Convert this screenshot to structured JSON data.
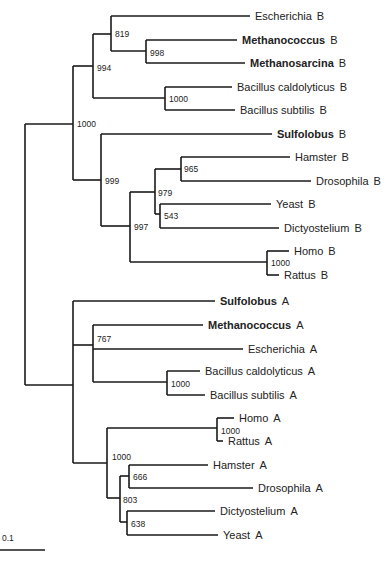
{
  "chart_data": {
    "type": "phylogenetic_tree",
    "title": "",
    "scale_bar": {
      "label": "0.1",
      "x1": 0,
      "x2": 45,
      "y": 550,
      "label_x": 2,
      "label_y": 541
    },
    "leaves": [
      {
        "id": "escherichia_b",
        "label": "Escherichia",
        "suffix": "B",
        "bold": false,
        "x": 250,
        "y": 16
      },
      {
        "id": "methanococcus_b",
        "label": "Methanococcus",
        "suffix": "B",
        "bold": true,
        "x": 237,
        "y": 40
      },
      {
        "id": "methanosarcina_b",
        "label": "Methanosarcina",
        "suffix": "B",
        "bold": true,
        "x": 245,
        "y": 63
      },
      {
        "id": "bacillus_caldolyticus_b",
        "label": "Bacillus caldolyticus",
        "suffix": "B",
        "bold": false,
        "x": 232,
        "y": 87
      },
      {
        "id": "bacillus_subtilis_b",
        "label": "Bacillus subtilis",
        "suffix": "B",
        "bold": false,
        "x": 235,
        "y": 110
      },
      {
        "id": "sulfolobus_b",
        "label": "Sulfolobus",
        "suffix": "B",
        "bold": true,
        "x": 272,
        "y": 134
      },
      {
        "id": "hamster_b",
        "label": "Hamster",
        "suffix": "B",
        "bold": false,
        "x": 290,
        "y": 157
      },
      {
        "id": "drosophila_b",
        "label": "Drosophila",
        "suffix": "B",
        "bold": false,
        "x": 311,
        "y": 181
      },
      {
        "id": "yeast_b",
        "label": "Yeast",
        "suffix": "B",
        "bold": false,
        "x": 271,
        "y": 204
      },
      {
        "id": "dictyostelium_b",
        "label": "Dictyostelium",
        "suffix": "B",
        "bold": false,
        "x": 279,
        "y": 228
      },
      {
        "id": "homo_b",
        "label": "Homo",
        "suffix": "B",
        "bold": false,
        "x": 289,
        "y": 251
      },
      {
        "id": "rattus_b",
        "label": "Rattus",
        "suffix": "B",
        "bold": false,
        "x": 279,
        "y": 275
      },
      {
        "id": "sulfolobus_a",
        "label": "Sulfolobus",
        "suffix": "A",
        "bold": true,
        "x": 215,
        "y": 301
      },
      {
        "id": "methanococcus_a",
        "label": "Methanococcus",
        "suffix": "A",
        "bold": true,
        "x": 203,
        "y": 325
      },
      {
        "id": "escherichia_a",
        "label": "Escherichia",
        "suffix": "A",
        "bold": false,
        "x": 243,
        "y": 349
      },
      {
        "id": "bacillus_caldolyticus_a",
        "label": "Bacillus caldolyticus",
        "suffix": "A",
        "bold": false,
        "x": 200,
        "y": 371
      },
      {
        "id": "bacillus_subtilis_a",
        "label": "Bacillus subtilis",
        "suffix": "A",
        "bold": false,
        "x": 205,
        "y": 395
      },
      {
        "id": "homo_a",
        "label": "Homo",
        "suffix": "A",
        "bold": false,
        "x": 234,
        "y": 418
      },
      {
        "id": "rattus_a",
        "label": "Rattus",
        "suffix": "A",
        "bold": false,
        "x": 223,
        "y": 441
      },
      {
        "id": "hamster_a",
        "label": "Hamster",
        "suffix": "A",
        "bold": false,
        "x": 208,
        "y": 465
      },
      {
        "id": "drosophila_a",
        "label": "Drosophila",
        "suffix": "A",
        "bold": false,
        "x": 253,
        "y": 488
      },
      {
        "id": "dictyostelium_a",
        "label": "Dictyostelium",
        "suffix": "A",
        "bold": false,
        "x": 215,
        "y": 511
      },
      {
        "id": "yeast_a",
        "label": "Yeast",
        "suffix": "A",
        "bold": false,
        "x": 218,
        "y": 535
      }
    ],
    "nodes": [
      {
        "id": "root",
        "x": 25,
        "y_top": 124,
        "y_bottom": 385,
        "parent_y": null,
        "bootstrap": ""
      },
      {
        "id": "clade_b",
        "x": 73,
        "y_top": 66,
        "y_bottom": 180,
        "parent_y": 124,
        "bootstrap": "1000",
        "label_x": 77,
        "label_y": 127
      },
      {
        "id": "bact_arch_b",
        "x": 93,
        "y_top": 34,
        "y_bottom": 98,
        "parent_y": 66,
        "bootstrap": "994",
        "label_x": 97,
        "label_y": 71
      },
      {
        "id": "esch_meth_b",
        "x": 111,
        "y_top": 16,
        "y_bottom": 51,
        "parent_y": 34,
        "bootstrap": "819",
        "label_x": 115,
        "label_y": 37
      },
      {
        "id": "meth_b",
        "x": 146,
        "y_top": 40,
        "y_bottom": 63,
        "parent_y": 51,
        "bootstrap": "998",
        "label_x": 150,
        "label_y": 56
      },
      {
        "id": "bacillus_b",
        "x": 165,
        "y_top": 87,
        "y_bottom": 110,
        "parent_y": 98,
        "bootstrap": "1000",
        "label_x": 169,
        "label_y": 102
      },
      {
        "id": "euk_sulf_b",
        "x": 101,
        "y_top": 134,
        "y_bottom": 226,
        "parent_y": 180,
        "bootstrap": "999",
        "label_x": 105,
        "label_y": 184
      },
      {
        "id": "euk_b",
        "x": 130,
        "y_top": 192,
        "y_bottom": 262,
        "parent_y": 226,
        "bootstrap": "997",
        "label_x": 134,
        "label_y": 230
      },
      {
        "id": "euk_sub_b",
        "x": 155,
        "y_top": 169,
        "y_bottom": 214,
        "parent_y": 192,
        "bootstrap": "979",
        "label_x": 158,
        "label_y": 196
      },
      {
        "id": "ham_dros_b",
        "x": 181,
        "y_top": 157,
        "y_bottom": 181,
        "parent_y": 169,
        "bootstrap": "965",
        "label_x": 184,
        "label_y": 172
      },
      {
        "id": "yeast_dict_b",
        "x": 160,
        "y_top": 204,
        "y_bottom": 228,
        "parent_y": 214,
        "bootstrap": "543",
        "label_x": 164,
        "label_y": 219
      },
      {
        "id": "homo_rat_b",
        "x": 267,
        "y_top": 251,
        "y_bottom": 275,
        "parent_y": 262,
        "bootstrap": "1000",
        "label_x": 271,
        "label_y": 266
      },
      {
        "id": "clade_a",
        "x": 73,
        "y_top": 301,
        "y_bottom": 463,
        "parent_y": 385,
        "bootstrap": "",
        "label_x": 0,
        "label_y": 0
      },
      {
        "id": "bact_arch_a",
        "x": 93,
        "y_top": 325,
        "y_bottom": 382,
        "parent_y": 345,
        "bootstrap": "767",
        "label_x": 97,
        "label_y": 342
      },
      {
        "id": "bacillus_a",
        "x": 167,
        "y_top": 371,
        "y_bottom": 395,
        "parent_y": 382,
        "bootstrap": "1000",
        "label_x": 171,
        "label_y": 387
      },
      {
        "id": "euk_a",
        "x": 107,
        "y_top": 428,
        "y_bottom": 498,
        "parent_y": 463,
        "bootstrap": "1000",
        "label_x": 112,
        "label_y": 460
      },
      {
        "id": "homo_rat_a",
        "x": 217,
        "y_top": 418,
        "y_bottom": 441,
        "parent_y": 428,
        "bootstrap": "1000",
        "label_x": 221,
        "label_y": 434
      },
      {
        "id": "euk_sub_a",
        "x": 120,
        "y_top": 476,
        "y_bottom": 522,
        "parent_y": 498,
        "bootstrap": "803",
        "label_x": 123,
        "label_y": 503
      },
      {
        "id": "ham_dros_a",
        "x": 129,
        "y_top": 465,
        "y_bottom": 488,
        "parent_y": 476,
        "bootstrap": "666",
        "label_x": 133,
        "label_y": 480
      },
      {
        "id": "dict_yeast_a",
        "x": 127,
        "y_top": 511,
        "y_bottom": 535,
        "parent_y": 522,
        "bootstrap": "638",
        "label_x": 131,
        "label_y": 527
      }
    ],
    "edges": [
      {
        "from_x": 25,
        "to_x": 73,
        "y": 124
      },
      {
        "from_x": 25,
        "to_x": 73,
        "y": 385
      },
      {
        "from_x": 73,
        "to_x": 93,
        "y": 66
      },
      {
        "from_x": 93,
        "to_x": 111,
        "y": 34
      },
      {
        "from_x": 111,
        "to_x": 250,
        "y": 16
      },
      {
        "from_x": 111,
        "to_x": 146,
        "y": 51
      },
      {
        "from_x": 146,
        "to_x": 237,
        "y": 40
      },
      {
        "from_x": 146,
        "to_x": 245,
        "y": 63
      },
      {
        "from_x": 93,
        "to_x": 165,
        "y": 98
      },
      {
        "from_x": 165,
        "to_x": 232,
        "y": 87
      },
      {
        "from_x": 165,
        "to_x": 235,
        "y": 110
      },
      {
        "from_x": 73,
        "to_x": 101,
        "y": 180
      },
      {
        "from_x": 101,
        "to_x": 272,
        "y": 134
      },
      {
        "from_x": 101,
        "to_x": 130,
        "y": 226
      },
      {
        "from_x": 130,
        "to_x": 155,
        "y": 192
      },
      {
        "from_x": 155,
        "to_x": 181,
        "y": 169
      },
      {
        "from_x": 181,
        "to_x": 290,
        "y": 157
      },
      {
        "from_x": 181,
        "to_x": 311,
        "y": 181
      },
      {
        "from_x": 155,
        "to_x": 160,
        "y": 214
      },
      {
        "from_x": 160,
        "to_x": 271,
        "y": 204
      },
      {
        "from_x": 160,
        "to_x": 279,
        "y": 228
      },
      {
        "from_x": 130,
        "to_x": 267,
        "y": 262
      },
      {
        "from_x": 267,
        "to_x": 289,
        "y": 251
      },
      {
        "from_x": 267,
        "to_x": 279,
        "y": 275
      },
      {
        "from_x": 73,
        "to_x": 215,
        "y": 301
      },
      {
        "from_x": 73,
        "to_x": 93,
        "y": 345
      },
      {
        "from_x": 93,
        "to_x": 203,
        "y": 325
      },
      {
        "from_x": 93,
        "to_x": 243,
        "y": 349
      },
      {
        "from_x": 93,
        "to_x": 167,
        "y": 382
      },
      {
        "from_x": 167,
        "to_x": 200,
        "y": 371
      },
      {
        "from_x": 167,
        "to_x": 205,
        "y": 395
      },
      {
        "from_x": 73,
        "to_x": 107,
        "y": 463
      },
      {
        "from_x": 107,
        "to_x": 217,
        "y": 428
      },
      {
        "from_x": 217,
        "to_x": 234,
        "y": 418
      },
      {
        "from_x": 217,
        "to_x": 223,
        "y": 441
      },
      {
        "from_x": 107,
        "to_x": 120,
        "y": 498
      },
      {
        "from_x": 120,
        "to_x": 129,
        "y": 476
      },
      {
        "from_x": 129,
        "to_x": 208,
        "y": 465
      },
      {
        "from_x": 129,
        "to_x": 253,
        "y": 488
      },
      {
        "from_x": 120,
        "to_x": 127,
        "y": 522
      },
      {
        "from_x": 127,
        "to_x": 215,
        "y": 511
      },
      {
        "from_x": 127,
        "to_x": 218,
        "y": 535
      }
    ]
  }
}
